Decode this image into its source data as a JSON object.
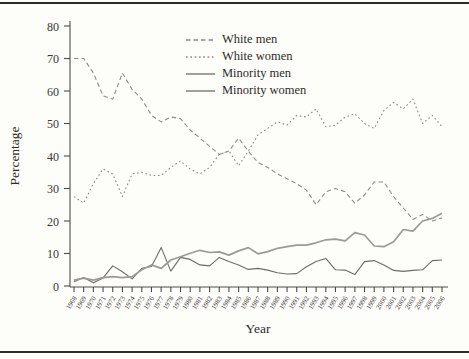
{
  "chart_data": {
    "type": "line",
    "title": "",
    "xlabel": "Year",
    "ylabel": "Percentage",
    "ylim": [
      0,
      80
    ],
    "ytick_step": 10,
    "grid": false,
    "legend_position": "inside-top-center",
    "x": [
      1968,
      1969,
      1970,
      1971,
      1972,
      1973,
      1974,
      1975,
      1976,
      1977,
      1978,
      1979,
      1980,
      1981,
      1982,
      1983,
      1984,
      1985,
      1986,
      1987,
      1988,
      1989,
      1990,
      1991,
      1992,
      1993,
      1994,
      1995,
      1996,
      1997,
      1998,
      1999,
      2000,
      2001,
      2002,
      2003,
      2004,
      2005,
      2006
    ],
    "series": [
      {
        "name": "White men",
        "style": "dashed",
        "dash": "4.5,3",
        "color": "#8c8c8c",
        "width": 1.1,
        "values": [
          70,
          70,
          65.5,
          58.5,
          57.5,
          65.5,
          60.5,
          57.5,
          52.5,
          50.5,
          52,
          51.5,
          48,
          45.5,
          43,
          40.5,
          41.5,
          45.5,
          41.5,
          38,
          36.5,
          34.5,
          33,
          31.5,
          29.5,
          25,
          29,
          30,
          29,
          25.5,
          28,
          32,
          32,
          27.5,
          24,
          20.5,
          22,
          20,
          21
        ]
      },
      {
        "name": "White women",
        "style": "dotted",
        "dash": "1.7,2.6",
        "color": "#8c8c8c",
        "width": 1.1,
        "values": [
          27.5,
          25.5,
          31.5,
          36,
          34.5,
          27.5,
          34.5,
          35,
          34,
          34,
          36.5,
          38.5,
          36,
          34.5,
          36.5,
          40.5,
          41.5,
          37,
          41.5,
          46.5,
          48.5,
          50.5,
          49.5,
          52.5,
          52,
          54.5,
          49,
          49.5,
          52,
          53,
          50,
          48.5,
          54,
          56.5,
          54.5,
          57.5,
          50,
          52.5,
          49
        ]
      },
      {
        "name": "Minority men",
        "style": "solid",
        "dash": "",
        "color": "#6e6c69",
        "width": 1.1,
        "values": [
          1.3,
          2.6,
          1,
          2.5,
          6.2,
          4.4,
          2.2,
          5.4,
          6,
          11.8,
          4.6,
          8.8,
          8.2,
          6.5,
          6.2,
          8.8,
          7.5,
          6.5,
          5.1,
          5.4,
          4.9,
          4.1,
          3.7,
          3.8,
          5.9,
          7.5,
          8.5,
          5,
          4.9,
          3.5,
          7.5,
          7.8,
          6.5,
          4.8,
          4.5,
          4.8,
          5,
          7.8,
          8
        ]
      },
      {
        "name": "Minority women",
        "style": "solid",
        "dash": "",
        "color": "#9c9a97",
        "width": 1.7,
        "values": [
          1.8,
          2.4,
          1.8,
          2.6,
          2.9,
          2.6,
          2.9,
          5,
          6.5,
          5.4,
          8,
          9,
          10.1,
          11,
          10.3,
          10.5,
          9.5,
          10.8,
          11.8,
          9.9,
          10.6,
          11.6,
          12.1,
          12.6,
          12.6,
          13.3,
          14.2,
          14.4,
          13.9,
          16.4,
          15.7,
          12.3,
          12.1,
          13.6,
          17.4,
          16.9,
          20,
          20.8,
          22.4
        ]
      }
    ]
  }
}
